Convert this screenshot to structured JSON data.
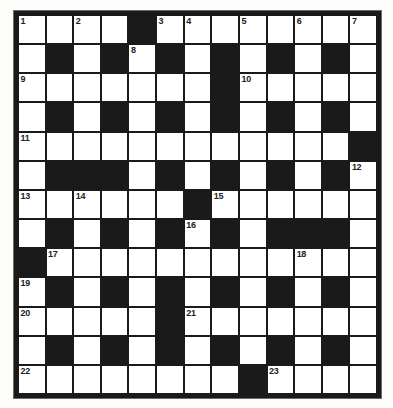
{
  "puzzle": {
    "title": "Crossword Grid",
    "rows": 13,
    "cols": 13,
    "colors": {
      "block": "#1a1a1a",
      "cell": "#ffffff",
      "frame": "#1a1a1a",
      "number_text": "#222222",
      "page_background": "#ffffff"
    },
    "legend": {
      "black_symbol": "B",
      "white_symbol": "W"
    },
    "grid": [
      [
        "W",
        "W",
        "W",
        "W",
        "B",
        "W",
        "W",
        "W",
        "W",
        "W",
        "W",
        "W",
        "W"
      ],
      [
        "W",
        "B",
        "W",
        "B",
        "W",
        "B",
        "W",
        "B",
        "W",
        "B",
        "W",
        "B",
        "W"
      ],
      [
        "W",
        "W",
        "W",
        "W",
        "W",
        "W",
        "W",
        "B",
        "W",
        "W",
        "W",
        "W",
        "W"
      ],
      [
        "W",
        "B",
        "W",
        "B",
        "W",
        "B",
        "W",
        "B",
        "W",
        "B",
        "W",
        "B",
        "W"
      ],
      [
        "W",
        "W",
        "W",
        "W",
        "W",
        "W",
        "W",
        "W",
        "W",
        "W",
        "W",
        "W",
        "B"
      ],
      [
        "W",
        "B",
        "B",
        "B",
        "W",
        "B",
        "W",
        "B",
        "W",
        "B",
        "W",
        "B",
        "W"
      ],
      [
        "W",
        "W",
        "W",
        "W",
        "W",
        "W",
        "B",
        "W",
        "W",
        "W",
        "W",
        "W",
        "W"
      ],
      [
        "W",
        "B",
        "W",
        "B",
        "W",
        "B",
        "W",
        "B",
        "W",
        "B",
        "B",
        "B",
        "W"
      ],
      [
        "B",
        "W",
        "W",
        "W",
        "W",
        "W",
        "W",
        "W",
        "W",
        "W",
        "W",
        "W",
        "W"
      ],
      [
        "W",
        "B",
        "W",
        "B",
        "W",
        "B",
        "W",
        "B",
        "W",
        "B",
        "W",
        "B",
        "W"
      ],
      [
        "W",
        "W",
        "W",
        "W",
        "W",
        "B",
        "W",
        "W",
        "W",
        "W",
        "W",
        "W",
        "W"
      ],
      [
        "W",
        "B",
        "W",
        "B",
        "W",
        "B",
        "W",
        "B",
        "W",
        "B",
        "W",
        "B",
        "W"
      ],
      [
        "W",
        "W",
        "W",
        "W",
        "W",
        "W",
        "W",
        "W",
        "B",
        "W",
        "W",
        "W",
        "W"
      ]
    ],
    "numbers": [
      {
        "row": 0,
        "col": 0,
        "label": "1"
      },
      {
        "row": 0,
        "col": 2,
        "label": "2"
      },
      {
        "row": 0,
        "col": 5,
        "label": "3"
      },
      {
        "row": 0,
        "col": 6,
        "label": "4"
      },
      {
        "row": 0,
        "col": 8,
        "label": "5"
      },
      {
        "row": 0,
        "col": 10,
        "label": "6"
      },
      {
        "row": 0,
        "col": 12,
        "label": "7"
      },
      {
        "row": 1,
        "col": 4,
        "label": "8"
      },
      {
        "row": 2,
        "col": 0,
        "label": "9"
      },
      {
        "row": 2,
        "col": 8,
        "label": "10"
      },
      {
        "row": 4,
        "col": 0,
        "label": "11"
      },
      {
        "row": 5,
        "col": 12,
        "label": "12"
      },
      {
        "row": 6,
        "col": 0,
        "label": "13"
      },
      {
        "row": 6,
        "col": 2,
        "label": "14"
      },
      {
        "row": 6,
        "col": 7,
        "label": "15"
      },
      {
        "row": 7,
        "col": 6,
        "label": "16"
      },
      {
        "row": 8,
        "col": 1,
        "label": "17"
      },
      {
        "row": 8,
        "col": 10,
        "label": "18"
      },
      {
        "row": 9,
        "col": 0,
        "label": "19"
      },
      {
        "row": 10,
        "col": 0,
        "label": "20"
      },
      {
        "row": 10,
        "col": 6,
        "label": "21"
      },
      {
        "row": 12,
        "col": 0,
        "label": "22"
      },
      {
        "row": 12,
        "col": 9,
        "label": "23"
      }
    ]
  }
}
